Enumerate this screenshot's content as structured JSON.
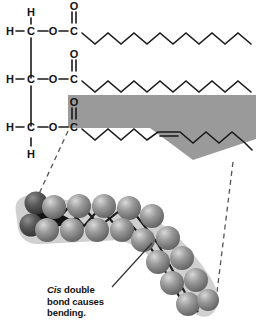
{
  "figure": {
    "title": "Unsaturated fat (triglyceride) structure with cis double bond",
    "background_color": "#ffffff",
    "bond_color": "#1a1a1a",
    "highlight_band_color": "#9a9a9a",
    "sphere_color": "#8c8c8c",
    "sphere_dark_color": "#4a4a4a",
    "model_halo_color": "#c9c9c9"
  },
  "caption": {
    "emphasis": "Cis",
    "line1_rest": " double",
    "line2": "bond causes",
    "line3": "bending."
  },
  "skeletal": {
    "backbone_rows": [
      {
        "atoms": [
          "H",
          "C",
          "O",
          "C"
        ],
        "top_label": "H",
        "carbonyl_oxygen": "O"
      },
      {
        "atoms": [
          "H",
          "C",
          "O",
          "C"
        ],
        "top_label": "",
        "carbonyl_oxygen": "O"
      },
      {
        "atoms": [
          "H",
          "C",
          "O",
          "C"
        ],
        "bottom_label": "H",
        "carbonyl_oxygen": "O"
      }
    ],
    "chains": [
      {
        "name": "chain-1",
        "saturation": "saturated",
        "double_bonds": 0
      },
      {
        "name": "chain-2",
        "saturation": "saturated",
        "double_bonds": 0
      },
      {
        "name": "chain-3",
        "saturation": "unsaturated",
        "double_bonds": 1,
        "geometry": "cis",
        "highlighted": true
      }
    ]
  },
  "space_filling_model": {
    "label": "space-filling model of cis-unsaturated fatty acid tail",
    "bend_direction": "downward-right"
  }
}
